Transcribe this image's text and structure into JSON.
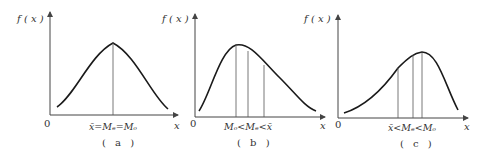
{
  "panels": [
    {
      "id": "a",
      "y_axis_label": "f ( x )",
      "x_axis_label": "x",
      "origin_label": "0",
      "relation": {
        "parts": [
          "x̄",
          "=",
          "M",
          "e",
          "=",
          "M",
          "o"
        ]
      },
      "relation_text": "x̄=Mₑ=Mₒ",
      "caption": "( a )",
      "shape": "symmetric"
    },
    {
      "id": "b",
      "y_axis_label": "f ( x )",
      "x_axis_label": "x",
      "origin_label": "0",
      "relation_text": "Mₒ<Mₑ<x̄",
      "caption": "( b )",
      "shape": "right-skewed"
    },
    {
      "id": "c",
      "y_axis_label": "f ( x )",
      "x_axis_label": "x",
      "origin_label": "0",
      "relation_text": "x̄<Mₑ<Mₒ",
      "caption": "( c )",
      "shape": "left-skewed"
    }
  ],
  "colors": {
    "curve": "#1a1a1a",
    "axis": "#444444",
    "guide": "#555555"
  }
}
